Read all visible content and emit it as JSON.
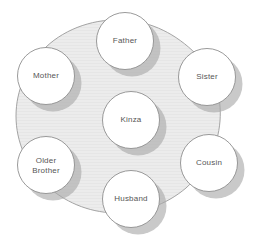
{
  "canvas": {
    "width": 264,
    "height": 245,
    "background_color": "#ffffff"
  },
  "colors": {
    "page_background": "#ffffff",
    "hub_fill": "#ececec",
    "hub_stroke": "#9a9a9a",
    "node_fill": "#ffffff",
    "node_stroke": "#8f8f8f",
    "shadow": "#a9a9a9",
    "label_text": "#565656"
  },
  "diagram": {
    "type": "radial-cycle",
    "center_node": {
      "id": "kinza",
      "label": "Kinza",
      "cx": 131,
      "cy": 120,
      "r": 28.5
    },
    "hub_shape": {
      "name": "rounded-heptagon-background",
      "cx": 131,
      "cy": 118,
      "rx": 93,
      "ry": 98
    },
    "outer_nodes": [
      {
        "id": "father",
        "label": "Father",
        "cx": 125,
        "cy": 41,
        "r": 28.5,
        "angle_deg": 270
      },
      {
        "id": "sister",
        "label": "Sister",
        "cx": 207,
        "cy": 77,
        "r": 28.5,
        "angle_deg": 330
      },
      {
        "id": "cousin",
        "label": "Cousin",
        "cx": 209,
        "cy": 163,
        "r": 28.5,
        "angle_deg": 30
      },
      {
        "id": "husband",
        "label": "Husband",
        "cx": 131,
        "cy": 199,
        "r": 28.5,
        "angle_deg": 90
      },
      {
        "id": "older-brother",
        "label": "Older\nBrother",
        "cx": 46,
        "cy": 165,
        "r": 28.5,
        "angle_deg": 150
      },
      {
        "id": "mother",
        "label": "Mother",
        "cx": 46,
        "cy": 76,
        "r": 28.5,
        "angle_deg": 210
      }
    ]
  }
}
